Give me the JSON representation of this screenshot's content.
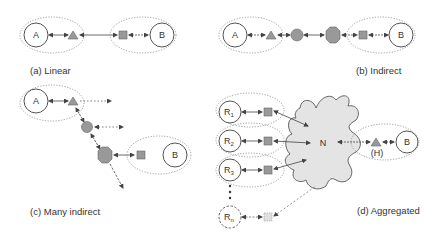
{
  "colors": {
    "stroke": "#555555",
    "fill_gray": "#999999",
    "cloud_fill": "#e4e4e4",
    "dotted": "#888888"
  },
  "panels": {
    "a": {
      "caption": "(a) Linear",
      "endpoint_a": "A",
      "endpoint_b": "B"
    },
    "b": {
      "caption": "(b) Indirect",
      "endpoint_a": "A",
      "endpoint_b": "B"
    },
    "c": {
      "caption": "(c) Many indirect",
      "endpoint_a": "A",
      "endpoint_b": "B"
    },
    "d": {
      "caption": "(d) Aggregated",
      "relays": [
        "R1",
        "R2",
        "R3",
        "Rn"
      ],
      "relay_main": "R",
      "relay_subs": [
        "1",
        "2",
        "3",
        "n"
      ],
      "network": "N",
      "hidden_label": "(H)",
      "endpoint_b": "B"
    }
  }
}
